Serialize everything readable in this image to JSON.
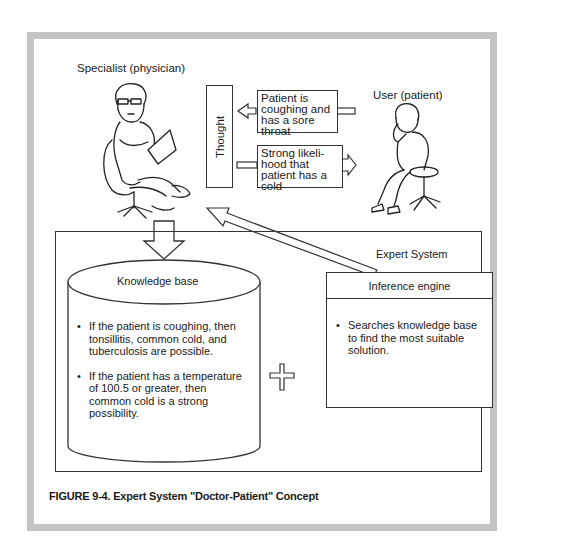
{
  "figure": {
    "caption": "FIGURE 9-4.  Expert System \"Doctor-Patient\" Concept",
    "frame_color": "#c4c4c4"
  },
  "actors": {
    "specialist_label": "Specialist (physician)",
    "user_label": "User (patient)"
  },
  "thought_label": "Thought",
  "messages": {
    "from_patient": [
      "Patient is",
      "coughing and",
      "has a sore",
      "throat"
    ],
    "to_patient": [
      "Strong likeli-",
      "hood that",
      "patient has a",
      "cold"
    ]
  },
  "expert_system": {
    "title": "Expert System",
    "knowledge_base": {
      "title": "Knowledge base",
      "rules": [
        [
          "If the patient is coughing, then",
          "tonsillitis, common cold, and",
          "tuberculosis are possible."
        ],
        [
          "If the patient has a temperature",
          "of 100.5 or greater, then",
          "common cold is a strong",
          "possibility."
        ]
      ]
    },
    "inference_engine": {
      "title": "Inference engine",
      "items": [
        [
          "Searches knowledge base",
          "to find the most suitable",
          "solution."
        ]
      ]
    },
    "bullet_char": "•"
  }
}
